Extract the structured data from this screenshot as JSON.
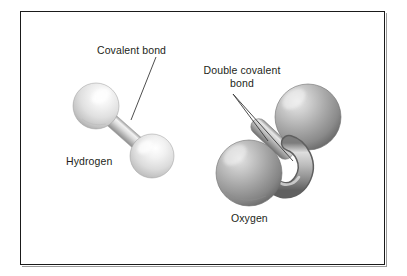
{
  "figure": {
    "kind": "molecular-ball-and-stick-diagram",
    "background_color": "#ffffff",
    "frame": {
      "border_color": "#1a1a1a",
      "shadow_color": "#9a9a9a"
    }
  },
  "labels": {
    "covalent_bond": "Covalent bond",
    "double_covalent_bond_line1": "Double covalent",
    "double_covalent_bond_line2": "bond",
    "hydrogen": "Hydrogen",
    "oxygen": "Oxygen"
  },
  "molecules": [
    {
      "name": "Hydrogen",
      "formula": "H2",
      "atom_count": 2,
      "bond_type": "single covalent bond",
      "bond_count": 1,
      "sphere_color_light": "#fbfbfb",
      "sphere_color_mid": "#d8d8d8",
      "sphere_color_dark": "#a6a6a6",
      "atoms": [
        {
          "cx": 96,
          "cy": 106,
          "r": 23
        },
        {
          "cx": 152,
          "cy": 156,
          "r": 22
        }
      ]
    },
    {
      "name": "Oxygen",
      "formula": "O2",
      "atom_count": 2,
      "bond_type": "double covalent bond",
      "bond_count": 2,
      "sphere_color_light": "#d9d9d9",
      "sphere_color_mid": "#a3a3a3",
      "sphere_color_dark": "#6b6b6b",
      "atoms": [
        {
          "cx": 308,
          "cy": 117,
          "r": 33
        },
        {
          "cx": 249,
          "cy": 173,
          "r": 33
        }
      ]
    }
  ],
  "leader_lines": {
    "covalent_bond": {
      "from_x": 156,
      "from_y": 57,
      "to_x": 131,
      "to_y": 120
    },
    "double_covalent_bond_upper": {
      "from_x": 233,
      "from_y": 94,
      "to_x": 268,
      "to_y": 140
    },
    "double_covalent_bond_lower": {
      "from_x": 233,
      "from_y": 94,
      "to_x": 292,
      "to_y": 160
    }
  },
  "colors": {
    "text": "#231f20",
    "leader_line": "#3a3a3a"
  }
}
